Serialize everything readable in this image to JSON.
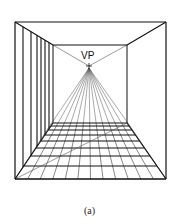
{
  "figure": {
    "vp_label": "VP",
    "caption": "(a)",
    "outer_box": {
      "x1": 15,
      "y1": 22,
      "x2": 166,
      "y2": 179
    },
    "inner_box": {
      "x1": 53,
      "y1": 45,
      "x2": 127,
      "y2": 123
    },
    "vanishing_point": {
      "x": 89,
      "y": 66
    },
    "floor_rows": [
      123,
      126,
      130,
      135,
      141,
      148,
      156,
      166,
      179
    ],
    "floor_rays": 12,
    "wall_lines_x": [
      23,
      31,
      37,
      41,
      45,
      49
    ],
    "colors": {
      "line": "#111111",
      "thin": "#555555"
    }
  }
}
